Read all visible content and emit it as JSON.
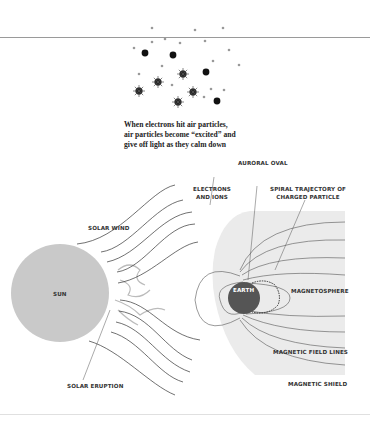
{
  "caption": {
    "line1": "When electrons hit air particles,",
    "line2": "air particles become “excited” and",
    "line3": "give off light as they calm down"
  },
  "labels": {
    "auroral_oval": "AURORAL OVAL",
    "electrons_ions_1": "ELECTRONS",
    "electrons_ions_2": "AND IONS",
    "spiral_1": "SPIRAL TRAJECTORY OF",
    "spiral_2": "CHARGED PARTICLE",
    "solar_wind": "SOLAR WIND",
    "sun": "SUN",
    "earth": "EARTH",
    "magnetosphere": "MAGNETOSPHERE",
    "magnetic_field_lines": "MAGNETIC FIELD LINES",
    "magnetic_shield": "MAGNETIC SHIELD",
    "solar_eruption": "SOLAR ERUPTION"
  },
  "colors": {
    "sun_fill": "#c9c9c9",
    "shield_fill": "#ebebeb",
    "earth_fill": "#555555",
    "line": "#333333"
  }
}
